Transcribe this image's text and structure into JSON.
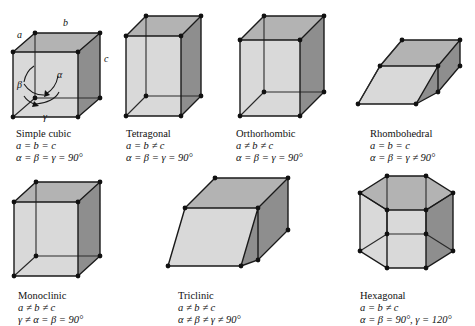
{
  "figure": {
    "background": "#ffffff",
    "face_colors": {
      "top": "#b3b3b3",
      "right": "#8e8e8e",
      "front": "#d9d9d9",
      "left": "#cfcfcf",
      "edge": "#1a1a1a",
      "vertex": "#111111"
    }
  },
  "axis_labels": {
    "a": "a",
    "b": "b",
    "c": "c",
    "alpha": "α",
    "beta": "β",
    "gamma": "γ"
  },
  "cells": [
    {
      "id": "simple-cubic",
      "name": "Simple cubic",
      "edge_relation": "a = b = c",
      "angle_relation": "α = β = γ = 90°",
      "shape": "cube"
    },
    {
      "id": "tetragonal",
      "name": "Tetragonal",
      "edge_relation": "a = b ≠ c",
      "angle_relation": "α = β = γ = 90°",
      "shape": "square-prism"
    },
    {
      "id": "orthorhombic",
      "name": "Orthorhombic",
      "edge_relation": "a ≠ b ≠ c",
      "angle_relation": "α = β = γ = 90°",
      "shape": "rectangular-prism"
    },
    {
      "id": "rhombohedral",
      "name": "Rhombohedral",
      "edge_relation": "a = b = c",
      "angle_relation": "α = β = γ ≠ 90°",
      "shape": "rhombohedron"
    },
    {
      "id": "monoclinic",
      "name": "Monoclinic",
      "edge_relation": "a ≠ b ≠ c",
      "angle_relation": "γ ≠ α = β = 90°",
      "shape": "oblique-prism"
    },
    {
      "id": "triclinic",
      "name": "Triclinic",
      "edge_relation": "a ≠ b ≠ c",
      "angle_relation": "α ≠ β ≠ γ ≠ 90°",
      "shape": "triclinic-parallelepiped"
    },
    {
      "id": "hexagonal",
      "name": "Hexagonal",
      "edge_relation": "a = b ≠ c",
      "angle_relation": "α = β = 90°, γ = 120°",
      "shape": "hexagonal-prism"
    }
  ]
}
